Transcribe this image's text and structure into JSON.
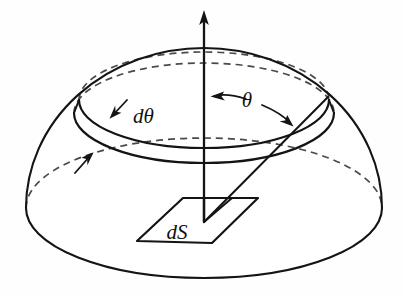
{
  "figure": {
    "background_color": "#fefefe",
    "ink_color": "#141414",
    "hidden_line_color": "#4a4a4a",
    "width": 404,
    "height": 295
  },
  "labels": {
    "d_theta": "dθ",
    "theta": "θ",
    "dS": "dS"
  },
  "label_positions": {
    "d_theta": {
      "x": 133,
      "y": 123,
      "font_size": 21
    },
    "theta": {
      "x": 247,
      "y": 107,
      "font_size": 21
    },
    "dS": {
      "x": 177,
      "y": 239,
      "font_size": 21
    }
  },
  "geometry": {
    "center": {
      "x": 204,
      "y": 208
    },
    "base_ellipse": {
      "cx": 204,
      "cy": 208,
      "rx": 178,
      "ry": 70
    },
    "dome_apex": {
      "x": 204,
      "y": 48
    },
    "ring_outer_ellipse": {
      "cx": 204,
      "cy": 113,
      "rx": 130,
      "ry": 50
    },
    "ring_inner_ellipse": {
      "cx": 204,
      "cy": 100,
      "rx": 125,
      "ry": 48
    },
    "axis": {
      "x": 204,
      "y_top": 10,
      "y_bottom": 222
    },
    "slant_ray": {
      "x1": 328,
      "y1": 98,
      "x2": 204,
      "y2": 222
    },
    "surface_element": {
      "left": {
        "x": 137,
        "y": 241
      },
      "top_left": {
        "x": 183,
        "y": 198
      },
      "top_right": {
        "x": 258,
        "y": 198
      },
      "bottom_right": {
        "x": 212,
        "y": 243
      }
    }
  },
  "annotations": {
    "theta_arc_arrow": {
      "description": "double-headed arc spanning from vertical axis to slant ray",
      "left_head": {
        "x": 212,
        "y": 96
      },
      "right_head": {
        "x": 291,
        "y": 124
      }
    },
    "d_theta_arrows": {
      "description": "two short arrows pointing into the annular band",
      "upper": {
        "tail_x": 126,
        "tail_y": 101,
        "head_x": 110,
        "head_y": 118
      },
      "lower": {
        "tail_x": 76,
        "tail_y": 172,
        "head_x": 93,
        "head_y": 152
      }
    },
    "axis_arrow": {
      "description": "upward arrowhead on polar axis",
      "tip": {
        "x": 204,
        "y": 10
      }
    }
  },
  "parts": [
    {
      "name": "hemisphere-dome",
      "kind": "surface",
      "visible": true
    },
    {
      "name": "base-ellipse-front",
      "kind": "solid-edge",
      "visible": true
    },
    {
      "name": "base-ellipse-back",
      "kind": "hidden-edge",
      "visible": true
    },
    {
      "name": "annular-ring-band",
      "kind": "solid-edge",
      "visible": true
    },
    {
      "name": "annular-ring-back",
      "kind": "hidden-edge",
      "visible": true
    },
    {
      "name": "polar-axis",
      "kind": "axis",
      "visible": true
    },
    {
      "name": "slant-ray",
      "kind": "ray",
      "visible": true
    },
    {
      "name": "surface-element-dS",
      "kind": "patch",
      "visible": true
    }
  ]
}
